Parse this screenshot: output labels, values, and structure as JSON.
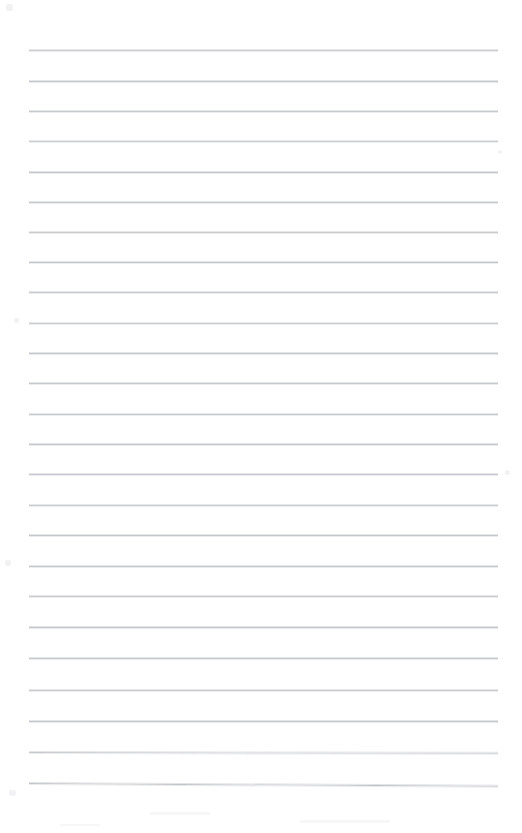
{
  "document": {
    "kind": "lined-notepad-page",
    "title": "Blank lined paper",
    "page_width": 522,
    "page_height": 833,
    "background_color": "#fefefe",
    "written_content": "",
    "header_text": "",
    "footer_text": "",
    "page_number": ""
  },
  "ruling": {
    "line_color": "#b9babe",
    "line_color_soft": "#dedfe2",
    "line_thickness_px": 1,
    "line_left_x": 29,
    "line_right_x": 498,
    "line_width_px": 469,
    "first_line_y": 50,
    "last_line_y": 783,
    "line_spacing_px": 30.5,
    "line_count": 25,
    "margin_top_px": 50,
    "margin_bottom_px": 50,
    "margin_left_px": 29,
    "margin_right_px": 24,
    "has_vertical_margin_rule": false,
    "lines": [
      {
        "index": 1,
        "y": 50,
        "tilt_deg": 0.0,
        "opacity": 0.72
      },
      {
        "index": 2,
        "y": 81,
        "tilt_deg": 0.0,
        "opacity": 0.8
      },
      {
        "index": 3,
        "y": 111,
        "tilt_deg": 0.0,
        "opacity": 0.76
      },
      {
        "index": 4,
        "y": 141,
        "tilt_deg": 0.0,
        "opacity": 0.7
      },
      {
        "index": 5,
        "y": 172,
        "tilt_deg": 0.0,
        "opacity": 0.82
      },
      {
        "index": 6,
        "y": 202,
        "tilt_deg": 0.0,
        "opacity": 0.78
      },
      {
        "index": 7,
        "y": 232,
        "tilt_deg": 0.0,
        "opacity": 0.74
      },
      {
        "index": 8,
        "y": 262,
        "tilt_deg": 0.0,
        "opacity": 0.8
      },
      {
        "index": 9,
        "y": 292,
        "tilt_deg": 0.0,
        "opacity": 0.76
      },
      {
        "index": 10,
        "y": 323,
        "tilt_deg": 0.0,
        "opacity": 0.72
      },
      {
        "index": 11,
        "y": 353,
        "tilt_deg": 0.0,
        "opacity": 0.8
      },
      {
        "index": 12,
        "y": 383,
        "tilt_deg": 0.0,
        "opacity": 0.78
      },
      {
        "index": 13,
        "y": 414,
        "tilt_deg": 0.0,
        "opacity": 0.74
      },
      {
        "index": 14,
        "y": 444,
        "tilt_deg": 0.0,
        "opacity": 0.8
      },
      {
        "index": 15,
        "y": 474,
        "tilt_deg": 0.0,
        "opacity": 0.76
      },
      {
        "index": 16,
        "y": 505,
        "tilt_deg": 0.0,
        "opacity": 0.72
      },
      {
        "index": 17,
        "y": 535,
        "tilt_deg": 0.0,
        "opacity": 0.8
      },
      {
        "index": 18,
        "y": 566,
        "tilt_deg": 0.0,
        "opacity": 0.78
      },
      {
        "index": 19,
        "y": 596,
        "tilt_deg": 0.0,
        "opacity": 0.74
      },
      {
        "index": 20,
        "y": 627,
        "tilt_deg": 0.0,
        "opacity": 0.82
      },
      {
        "index": 21,
        "y": 658,
        "tilt_deg": 0.0,
        "opacity": 0.78
      },
      {
        "index": 22,
        "y": 690,
        "tilt_deg": 0.0,
        "opacity": 0.74
      },
      {
        "index": 23,
        "y": 721,
        "tilt_deg": 0.0,
        "opacity": 0.8
      },
      {
        "index": 24,
        "y": 752,
        "tilt_deg": 0.1,
        "opacity": 0.78
      },
      {
        "index": 25,
        "y": 783,
        "tilt_deg": 0.35,
        "opacity": 0.86
      }
    ]
  }
}
